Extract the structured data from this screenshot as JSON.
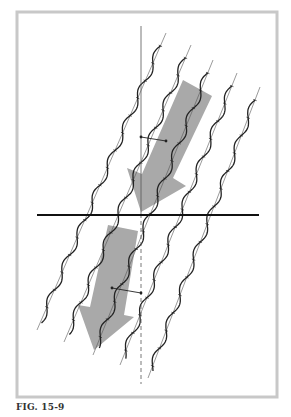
{
  "figure": {
    "caption": "FIG. 15-9",
    "frame": {
      "x": 17,
      "y": 12,
      "width": 260,
      "height": 385,
      "stroke": "#c8c8c8",
      "stroke_width": 3
    },
    "colors": {
      "arrow_fill": "#a9a9a9",
      "line": "#222222",
      "thin_line": "#555555",
      "horizontal_line": "#111111"
    },
    "vertical_axis": {
      "x": 141,
      "y_top": 26,
      "y_solid_end": 214,
      "y_bottom": 384,
      "dashed_below": true
    },
    "horizontal_line": {
      "x1": 37,
      "x2": 259,
      "y": 215
    },
    "fibers": [
      {
        "x_top": 166,
        "y_top": 33,
        "x_bot": 37,
        "y_bot": 330
      },
      {
        "x_top": 191,
        "y_top": 45,
        "x_bot": 64,
        "y_bot": 342
      },
      {
        "x_top": 213,
        "y_top": 60,
        "x_bot": 93,
        "y_bot": 355
      },
      {
        "x_top": 237,
        "y_top": 73,
        "x_bot": 120,
        "y_bot": 365
      },
      {
        "x_top": 260,
        "y_top": 87,
        "x_bot": 148,
        "y_bot": 378
      }
    ],
    "arrows": [
      {
        "name": "upper-arrow",
        "points": "183,80 212,96 173,178 186,186 141,212 127,168 142,174"
      },
      {
        "name": "lower-arrow",
        "points": "108,225 138,231 124,315 134,317 94,350 78,305 90,307"
      }
    ],
    "angle_markers": [
      {
        "x1": 141,
        "y1": 137,
        "x2": 166,
        "y2": 141
      },
      {
        "x1": 112,
        "y1": 288,
        "x2": 141,
        "y2": 293
      }
    ]
  }
}
